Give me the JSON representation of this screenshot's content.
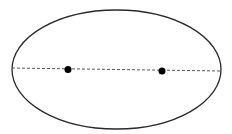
{
  "diagram": {
    "type": "ellipse-with-foci",
    "background": "#ffffff",
    "stroke_color": "#2a2a2a",
    "ellipse": {
      "cx": 116.5,
      "cy": 69.5,
      "rx": 104.5,
      "ry": 59.5
    },
    "major_axis": {
      "x1": 12,
      "y1": 68,
      "x2": 221,
      "y2": 71,
      "style": "dashed"
    },
    "foci": [
      {
        "x": 68,
        "y": 69.5,
        "r": 3.5
      },
      {
        "x": 162,
        "y": 71,
        "r": 3.5
      }
    ]
  }
}
